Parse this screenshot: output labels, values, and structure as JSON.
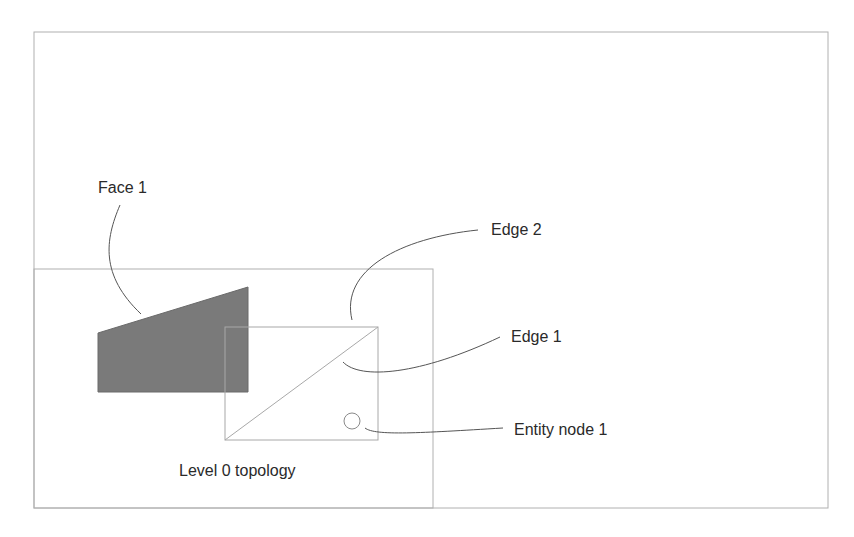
{
  "diagram": {
    "labels": {
      "face1": "Face 1",
      "edge2": "Edge 2",
      "edge1": "Edge 1",
      "entity_node1": "Entity node 1",
      "level0": "Level 0 topology"
    },
    "colors": {
      "frame": "#b0b0b0",
      "face_fill": "#7a7a7a",
      "leader": "#555555",
      "text": "#2a2a2a"
    }
  }
}
